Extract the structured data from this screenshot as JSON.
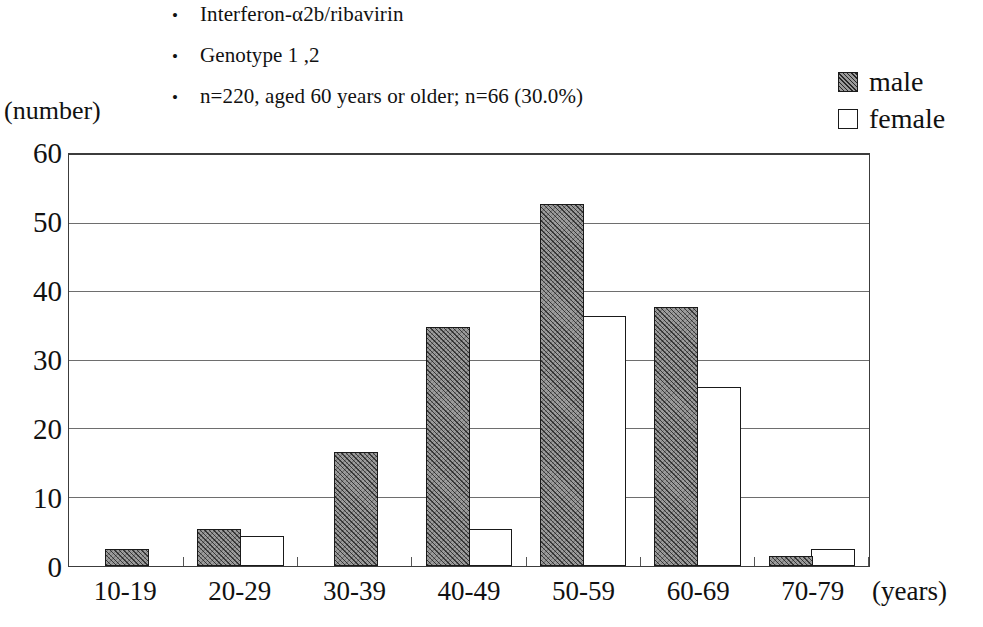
{
  "notes": {
    "bullet_char": "•",
    "items": [
      "Interferon-α2b/ribavirin",
      "Genotype 1 ,2",
      "n=220, aged 60 years or older; n=66 (30.0%)"
    ]
  },
  "legend": {
    "position": "top-right",
    "entries": [
      {
        "label": "male",
        "swatch": "hatched-square",
        "color": "#9c9c9c"
      },
      {
        "label": "female",
        "swatch": "empty-square",
        "color": "#ffffff"
      }
    ]
  },
  "axes": {
    "y_caption": "(number)",
    "x_unit": "(years)"
  },
  "chart_data": {
    "type": "bar",
    "title": "",
    "subtitle": "",
    "xlabel": "(years)",
    "ylabel": "(number)",
    "ylim": [
      0,
      60
    ],
    "yticks": [
      0,
      10,
      20,
      30,
      40,
      50,
      60
    ],
    "ytick_labels": [
      "0",
      "10",
      "20",
      "30",
      "40",
      "50",
      "60"
    ],
    "grid": "horizontal",
    "legend_position": "top-right",
    "categories": [
      "10-19",
      "20-29",
      "30-39",
      "40-49",
      "50-59",
      "60-69",
      "70-79"
    ],
    "series": [
      {
        "name": "male",
        "color": "#9c9c9c",
        "values": [
          2.5,
          5.3,
          16.5,
          34.7,
          52.5,
          37.5,
          1.5
        ]
      },
      {
        "name": "female",
        "color": "#ffffff",
        "values": [
          0,
          4.3,
          0,
          5.3,
          36.3,
          26.0,
          2.5
        ]
      }
    ]
  }
}
